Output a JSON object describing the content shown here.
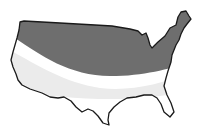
{
  "map": {
    "region": "Contiguous United States",
    "bands": [
      {
        "name": "northern-zone",
        "color": "#6e6e6e"
      },
      {
        "name": "middle-zone",
        "color": "#ebebeb"
      },
      {
        "name": "southern-zone",
        "color": "#ffffff"
      }
    ],
    "outline_color": "#1a1a1a",
    "background": "#ffffff"
  }
}
